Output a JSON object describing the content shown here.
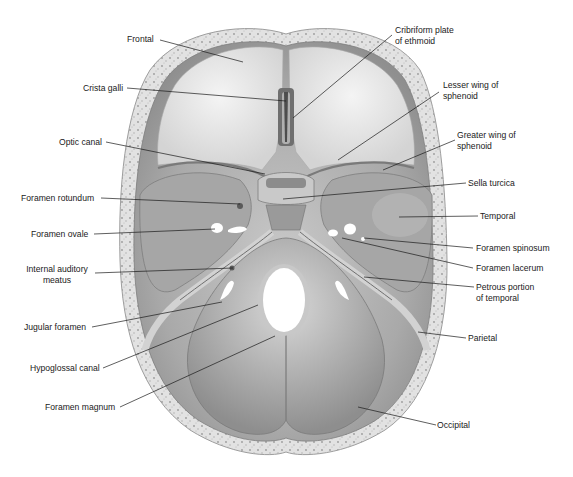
{
  "figure": {
    "colors": {
      "background": "#ffffff",
      "bone_rim": "#dcdcdc",
      "bone_fill": "#b9b9b9",
      "bone_light": "#e6e6e6",
      "bone_dark": "#8c8c8c",
      "leader_line": "#1a1a1a",
      "label_text": "#1a1a1a"
    }
  },
  "labels": {
    "left": [
      {
        "id": "frontal",
        "text": "Frontal"
      },
      {
        "id": "crista-galli",
        "text": "Crista galli"
      },
      {
        "id": "optic-canal",
        "text": "Optic canal"
      },
      {
        "id": "foramen-rotundum",
        "text": "Foramen rotundum"
      },
      {
        "id": "foramen-ovale",
        "text": "Foramen ovale"
      },
      {
        "id": "internal-auditory-meatus",
        "text": "Internal auditory\nmeatus"
      },
      {
        "id": "jugular-foramen",
        "text": "Jugular foramen"
      },
      {
        "id": "hypoglossal-canal",
        "text": "Hypoglossal canal"
      },
      {
        "id": "foramen-magnum",
        "text": "Foramen magnum"
      }
    ],
    "right": [
      {
        "id": "cribriform-plate",
        "text": "Cribriform plate\nof ethmoid"
      },
      {
        "id": "lesser-wing",
        "text": "Lesser wing of\nsphenoid"
      },
      {
        "id": "greater-wing",
        "text": "Greater wing of\nsphenoid"
      },
      {
        "id": "sella-turcica",
        "text": "Sella turcica"
      },
      {
        "id": "temporal",
        "text": "Temporal"
      },
      {
        "id": "foramen-spinosum",
        "text": "Foramen spinosum"
      },
      {
        "id": "foramen-lacerum",
        "text": "Foramen lacerum"
      },
      {
        "id": "petrous-portion",
        "text": "Petrous portion\nof temporal"
      },
      {
        "id": "parietal",
        "text": "Parietal"
      },
      {
        "id": "occipital",
        "text": "Occipital"
      }
    ]
  }
}
